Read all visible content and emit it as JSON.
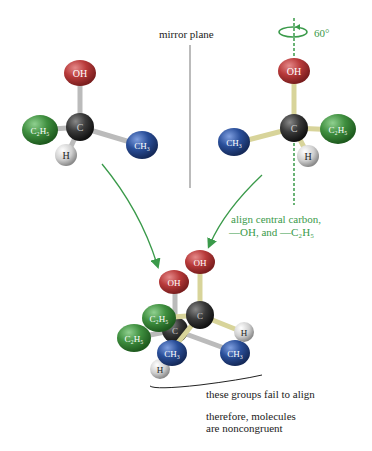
{
  "labels": {
    "mirror_plane": "mirror plane",
    "rotation": "60°",
    "align_line1": "align central carbon,",
    "align_line2": "—OH, and —C₂H₅",
    "fail_align": "these groups fail to align",
    "conclusion_line1": "therefore, molecules",
    "conclusion_line2": "are noncongruent"
  },
  "atoms": {
    "oh": "OH",
    "c": "C",
    "c2h5": "C₂H₅",
    "ch3": "CH₃",
    "h": "H"
  },
  "colors": {
    "oh": "#b83a3a",
    "c2h5": "#3f8f3f",
    "ch3": "#2a4f9a",
    "h": "#d8d8d8",
    "c": "#3a3a3a",
    "arrow": "#3a9a4a",
    "mirror": "#bbbbbb"
  }
}
